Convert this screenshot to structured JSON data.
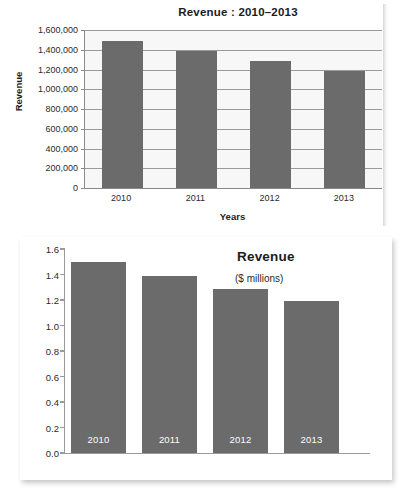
{
  "chart_data": [
    {
      "id": "top",
      "type": "bar",
      "title": "Revenue : 2010–2013",
      "xlabel": "Years",
      "ylabel": "Revenue",
      "categories": [
        "2010",
        "2011",
        "2012",
        "2013"
      ],
      "values": [
        1490000,
        1390000,
        1290000,
        1185000
      ],
      "ylim": [
        0,
        1600000
      ],
      "ytick_values": [
        0,
        200000,
        400000,
        600000,
        800000,
        1000000,
        1200000,
        1400000,
        1600000
      ],
      "ytick_labels": [
        "0",
        "200,000",
        "400,000",
        "600,000",
        "800,000",
        "1,000,000",
        "1,200,000",
        "1,400,000",
        "1,600,000"
      ],
      "grid": true,
      "legend": "none",
      "bar_color": "#6b6b6b",
      "plot_background": "#f7f7f7"
    },
    {
      "id": "bottom",
      "type": "bar",
      "title": "Revenue",
      "subtitle": "($ millions)",
      "xlabel": "",
      "ylabel": "",
      "categories": [
        "2010",
        "2011",
        "2012",
        "2013"
      ],
      "values": [
        1.5,
        1.39,
        1.29,
        1.19
      ],
      "ylim": [
        0.0,
        1.6
      ],
      "ytick_values": [
        0.0,
        0.2,
        0.4,
        0.6,
        0.8,
        1.0,
        1.2,
        1.4,
        1.6
      ],
      "ytick_labels": [
        "0.0",
        "0.2",
        "0.4",
        "0.6",
        "0.8",
        "1.0",
        "1.2",
        "1.4",
        "1.6"
      ],
      "grid": false,
      "legend": "top-right",
      "bar_color": "#6b6b6b",
      "bar_label_color": "#ffffff",
      "plot_background": "#ffffff"
    }
  ]
}
